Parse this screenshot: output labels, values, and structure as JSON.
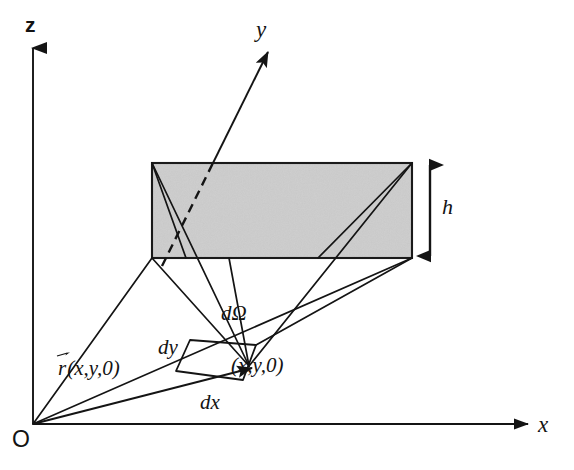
{
  "figure": {
    "kind": "3d-geometry-diagram",
    "background_color": "#ffffff",
    "line_color": "#1a1a1a",
    "slab_fill_color": "#d2d2d2",
    "slab_stroke_color": "#1a1a1a"
  },
  "axes": {
    "z": {
      "label": "z",
      "arrow": "up"
    },
    "y": {
      "label": "y",
      "arrow": "up-right",
      "hidden_segment_style": "dashed"
    },
    "x": {
      "label": "x",
      "arrow": "right"
    },
    "origin": {
      "label": "O"
    }
  },
  "slab": {
    "thickness_label": "h",
    "thickness_arrow": "double-headed-vertical"
  },
  "element": {
    "solid_angle_label": "dΩ",
    "width_label": "dx",
    "depth_label": "dy",
    "point_label": "(x,y,0)"
  },
  "vector": {
    "symbol": "r",
    "arguments": "(x,y,0)",
    "full_label": "r(x,y,0)",
    "accent": "vector-arrow"
  }
}
